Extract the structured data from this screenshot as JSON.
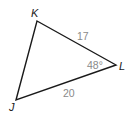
{
  "diagram": {
    "type": "triangle",
    "vertices": [
      {
        "name": "K",
        "x": 37,
        "y": 21,
        "label_x": 31,
        "label_y": 17
      },
      {
        "name": "L",
        "x": 116,
        "y": 65,
        "label_x": 119,
        "label_y": 70
      },
      {
        "name": "J",
        "x": 16,
        "y": 100,
        "label_x": 9,
        "label_y": 111
      }
    ],
    "sides": [
      {
        "from": "K",
        "to": "L",
        "length": "17",
        "label_x": 77,
        "label_y": 40
      },
      {
        "from": "J",
        "to": "L",
        "length": "20",
        "label_x": 63,
        "label_y": 97
      }
    ],
    "angles": [
      {
        "vertex": "L",
        "measure": "48°",
        "label_x": 87,
        "label_y": 69
      }
    ],
    "colors": {
      "stroke": "#1a1a1a",
      "measure_text": "#8a8a8a",
      "vertex_text": "#1a1a1a"
    }
  }
}
